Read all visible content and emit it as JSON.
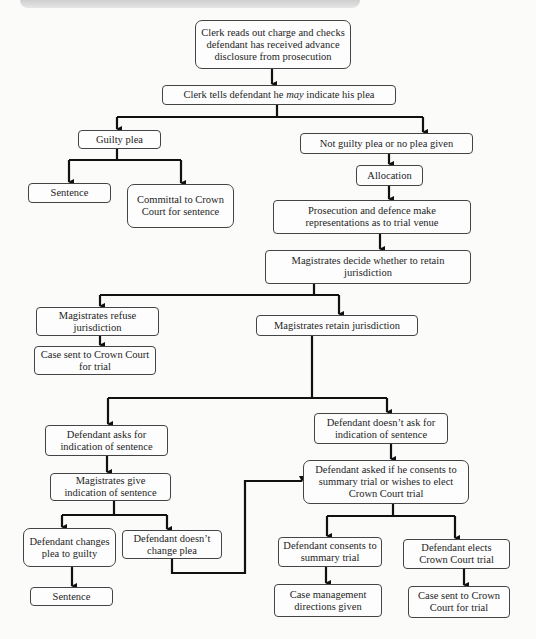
{
  "diagram": {
    "type": "flowchart",
    "nodes": {
      "n1": "Clerk reads out charge and checks defendant has received advance disclosure from prosecution",
      "n2_pre": "Clerk tells defendant he ",
      "n2_em": "may",
      "n2_post": " indicate his plea",
      "guilty": "Guilty plea",
      "sentence1": "Sentence",
      "committal": "Committal to Crown Court for sentence",
      "not_guilty": "Not guilty plea or no plea given",
      "allocation": "Allocation",
      "representations": "Prosecution and defence make representations as to trial venue",
      "decide": "Magistrates decide whether to retain jurisdiction",
      "refuse": "Magistrates refuse jurisdiction",
      "case_sent_left": "Case sent to Crown Court for trial",
      "retain": "Magistrates retain jurisdiction",
      "asks": "Defendant asks for indication of sentence",
      "doesnt_ask": "Defendant doesn’t ask for indication of sentence",
      "give_indication": "Magistrates give indication of sentence",
      "asked_consent": "Defendant asked if he consents to summary trial or wishes to elect Crown Court trial",
      "changes_plea": "Defendant changes plea to guilty",
      "doesnt_change": "Defendant doesn’t change plea",
      "sentence2": "Sentence",
      "consents": "Defendant consents to summary trial",
      "elects": "Defendant elects Crown Court trial",
      "case_mgmt": "Case management directions given",
      "case_sent_right": "Case sent to Crown Court for trial"
    },
    "edges": [
      [
        "n1",
        "n2"
      ],
      [
        "n2",
        "guilty"
      ],
      [
        "n2",
        "not_guilty"
      ],
      [
        "guilty",
        "sentence1"
      ],
      [
        "guilty",
        "committal"
      ],
      [
        "not_guilty",
        "allocation"
      ],
      [
        "allocation",
        "representations"
      ],
      [
        "representations",
        "decide"
      ],
      [
        "decide",
        "refuse"
      ],
      [
        "decide",
        "retain"
      ],
      [
        "refuse",
        "case_sent_left"
      ],
      [
        "retain",
        "asks"
      ],
      [
        "retain",
        "doesnt_ask"
      ],
      [
        "asks",
        "give_indication"
      ],
      [
        "give_indication",
        "changes_plea"
      ],
      [
        "give_indication",
        "doesnt_change"
      ],
      [
        "changes_plea",
        "sentence2"
      ],
      [
        "doesnt_change",
        "asked_consent"
      ],
      [
        "doesnt_ask",
        "asked_consent"
      ],
      [
        "asked_consent",
        "consents"
      ],
      [
        "asked_consent",
        "elects"
      ],
      [
        "consents",
        "case_mgmt"
      ],
      [
        "elects",
        "case_sent_right"
      ]
    ]
  },
  "colors": {
    "line": "#111111",
    "border": "#444444",
    "background": "#fbfbfa"
  }
}
